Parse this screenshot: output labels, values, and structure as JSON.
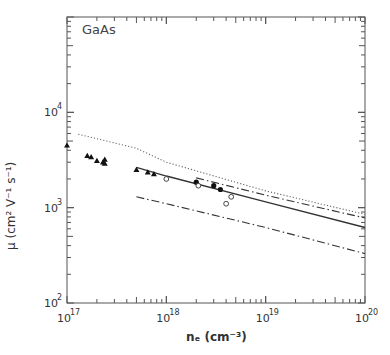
{
  "chart_data": {
    "type": "scatter",
    "title": "GaAs",
    "xlabel": "n_e (cm^-3)",
    "ylabel": "μ (cm^2 V^-1 s^-1)",
    "xscale": "log",
    "yscale": "log",
    "xlim": [
      1e+17,
      1e+20
    ],
    "ylim": [
      100.0,
      100000.0
    ],
    "x_ticks": [
      "10^17",
      "10^18",
      "10^19",
      "10^20"
    ],
    "y_ticks": [
      "10^2",
      "10^3",
      "10^4"
    ],
    "grid": false,
    "legend": null,
    "series": [
      {
        "name": "filled triangles",
        "kind": "points",
        "marker": "triangle-filled",
        "points": [
          [
            1e+17,
            4500
          ],
          [
            1.6e+17,
            3500
          ],
          [
            1.75e+17,
            3400
          ],
          [
            2e+17,
            3100
          ],
          [
            2.3e+17,
            3000
          ],
          [
            2.4e+17,
            2900
          ],
          [
            2.4e+17,
            3200
          ],
          [
            5e+17,
            2500
          ],
          [
            6.5e+17,
            2350
          ],
          [
            7.5e+17,
            2250
          ]
        ]
      },
      {
        "name": "filled circles",
        "kind": "points",
        "marker": "circle-filled",
        "points": [
          [
            2e+18,
            1850
          ],
          [
            3e+18,
            1700
          ],
          [
            3.5e+18,
            1550
          ]
        ]
      },
      {
        "name": "open circles",
        "kind": "points",
        "marker": "circle-open",
        "points": [
          [
            1e+18,
            2000
          ],
          [
            2.1e+18,
            1700
          ],
          [
            4e+18,
            1100
          ],
          [
            4.5e+18,
            1300
          ]
        ]
      },
      {
        "name": "solid line",
        "kind": "line",
        "style": "solid",
        "points": [
          [
            5e+17,
            2650
          ],
          [
            1e+18,
            2150
          ],
          [
            1e+19,
            1150
          ],
          [
            1e+20,
            620
          ]
        ]
      },
      {
        "name": "dotted line",
        "kind": "line",
        "style": "dotted",
        "points": [
          [
            1.3e+17,
            5900
          ],
          [
            5e+17,
            4200
          ],
          [
            1e+18,
            3000
          ],
          [
            1e+19,
            1500
          ],
          [
            1e+20,
            850
          ]
        ]
      },
      {
        "name": "dash-dot upper",
        "kind": "line",
        "style": "dashdot",
        "points": [
          [
            2e+18,
            2050
          ],
          [
            1e+19,
            1350
          ],
          [
            1e+20,
            780
          ]
        ]
      },
      {
        "name": "dash-dot lower",
        "kind": "line",
        "style": "dashdot",
        "points": [
          [
            5e+17,
            1300
          ],
          [
            1e+18,
            1100
          ],
          [
            1e+19,
            620
          ],
          [
            1e+20,
            330
          ]
        ]
      }
    ]
  },
  "labels": {
    "title": "GaAs",
    "ylabel": "μ (cm² V⁻¹ s⁻¹)",
    "xlabel": "nₑ (cm⁻³)",
    "x_ticks": [
      "10",
      "10",
      "10",
      "10"
    ],
    "x_exps": [
      "17",
      "18",
      "19",
      "20"
    ],
    "y_ticks": [
      "10",
      "10",
      "10"
    ],
    "y_exps": [
      "2",
      "3",
      "4"
    ]
  }
}
